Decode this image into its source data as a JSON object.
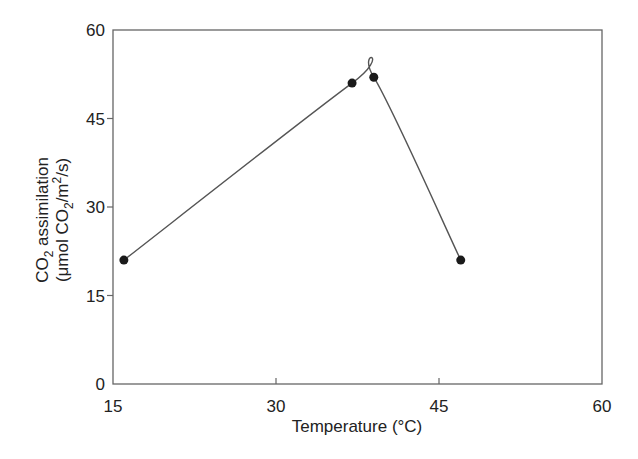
{
  "chart_data": {
    "type": "line",
    "title": "",
    "xlabel": "Temperature (°C)",
    "ylabel": {
      "line1": {
        "prefix": "CO",
        "sub": "2",
        "suffix": " assimilation"
      },
      "line2": {
        "prefix": "(μmol CO",
        "sub": "2",
        "mid": "/m",
        "sup": "2",
        "suffix": "/s)"
      }
    },
    "xlim": [
      15,
      60
    ],
    "ylim": [
      0,
      60
    ],
    "xticks": [
      15,
      30,
      45,
      60
    ],
    "yticks": [
      0,
      15,
      30,
      45,
      60
    ],
    "grid": false,
    "legend": null,
    "series": [
      {
        "name": "CO2 assimilation",
        "x": [
          16,
          37,
          39,
          47
        ],
        "y": [
          21,
          51,
          52,
          21
        ],
        "line_style": "smooth",
        "marker": "filled-circle"
      }
    ]
  },
  "colors": {
    "axis": "#666666",
    "line": "#555555",
    "marker": "#1a1a1a",
    "text": "#222222"
  }
}
